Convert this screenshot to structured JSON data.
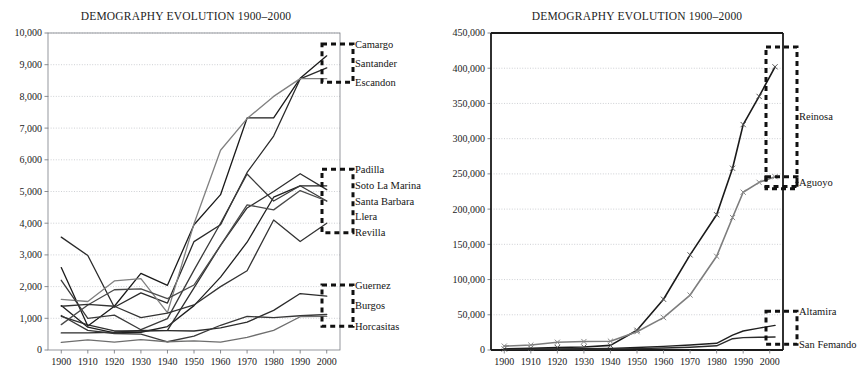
{
  "figure": {
    "name": "demography-evolution-two-panel-figure",
    "width": 866,
    "height": 387,
    "background": "#ffffff"
  },
  "chart_data": [
    {
      "panel": "left",
      "type": "line",
      "title": "DEMOGRAPHY EVOLUTION 1900–2000",
      "xlabel": "",
      "ylabel": "",
      "grid": true,
      "legend_position": "right-of-plot (direct line labels)",
      "x": [
        1900,
        1910,
        1920,
        1930,
        1940,
        1950,
        1960,
        1970,
        1980,
        1990,
        2000
      ],
      "xlim": [
        1895,
        2005
      ],
      "ylim": [
        0,
        10000
      ],
      "yticks": [
        0,
        1000,
        2000,
        3000,
        4000,
        5000,
        6000,
        7000,
        8000,
        9000,
        10000
      ],
      "ytick_labels": [
        "0",
        "1,000",
        "2,000",
        "3,000",
        "4,000",
        "5,000",
        "6,000",
        "7,000",
        "8,000",
        "9,000",
        "10,000"
      ],
      "xtick_labels": [
        "1900",
        "1910",
        "1920",
        "1930",
        "1940",
        "1950",
        "1960",
        "1970",
        "1980",
        "1990",
        "2000"
      ],
      "highlight_groups": [
        {
          "label_group": [
            "Camargo",
            "Santander",
            "Escandon"
          ],
          "y_top": 9650,
          "y_bottom": 8450
        },
        {
          "label_group": [
            "Padilla",
            "Soto La Marina",
            "Santa Barbara",
            "Llera",
            "Revilla"
          ],
          "y_top": 5700,
          "y_bottom": 3700
        },
        {
          "label_group": [
            "Guernez",
            "Burgos",
            "Horcasitas"
          ],
          "y_top": 2050,
          "y_bottom": 750
        }
      ],
      "series": [
        {
          "name": "Camargo",
          "color": "#1a1a1a",
          "width": 1.3,
          "values": [
            2600,
            760,
            1380,
            2420,
            2040,
            3950,
            4900,
            7320,
            7320,
            8570,
            9280
          ]
        },
        {
          "name": "Santander",
          "color": "#2a2a2a",
          "width": 1.3,
          "values": [
            3560,
            2980,
            1350,
            1800,
            1480,
            3420,
            3950,
            5600,
            6750,
            8550,
            8900
          ]
        },
        {
          "name": "Escandon",
          "color": "#808080",
          "width": 1.3,
          "values": [
            1600,
            1530,
            2180,
            2250,
            1180,
            3980,
            6300,
            7300,
            8000,
            8560,
            8560
          ]
        },
        {
          "name": "Padilla",
          "color": "#1f1f1f",
          "width": 1.3,
          "values": [
            1400,
            720,
            540,
            560,
            740,
            1400,
            2300,
            3400,
            4820,
            5180,
            5180
          ]
        },
        {
          "name": "Soto La Marina",
          "color": "#2e2e2e",
          "width": 1.3,
          "values": [
            1060,
            790,
            600,
            600,
            620,
            1960,
            3300,
            4480,
            5000,
            5560,
            5060
          ]
        },
        {
          "name": "Santa Barbara",
          "color": "#3a3a3a",
          "width": 1.3,
          "values": [
            2200,
            1000,
            1100,
            640,
            990,
            2520,
            4000,
            5550,
            4700,
            5180,
            4700
          ]
        },
        {
          "name": "Llera",
          "color": "#4a4a4a",
          "width": 1.3,
          "values": [
            800,
            1420,
            1900,
            1930,
            1620,
            2050,
            3300,
            4580,
            4420,
            5030,
            4700
          ]
        },
        {
          "name": "Revilla",
          "color": "#333333",
          "width": 1.3,
          "values": [
            1380,
            1440,
            1380,
            1020,
            1160,
            1420,
            2000,
            2500,
            4100,
            3420,
            4000
          ]
        },
        {
          "name": "Guernez",
          "color": "#2b2b2b",
          "width": 1.3,
          "values": [
            540,
            540,
            560,
            620,
            610,
            600,
            700,
            880,
            1250,
            1780,
            1700
          ]
        },
        {
          "name": "Burgos",
          "color": "#383838",
          "width": 1.3,
          "values": [
            1090,
            620,
            520,
            500,
            260,
            440,
            780,
            1060,
            1020,
            1080,
            1120
          ]
        },
        {
          "name": "Horcasitas",
          "color": "#6e6e6e",
          "width": 1.3,
          "values": [
            240,
            320,
            250,
            330,
            260,
            290,
            250,
            400,
            620,
            1050,
            1060
          ]
        }
      ]
    },
    {
      "panel": "right",
      "type": "line",
      "title": "DEMOGRAPHY EVOLUTION 1900–2000",
      "xlabel": "",
      "ylabel": "",
      "grid": true,
      "legend_position": "right-of-plot (direct line labels)",
      "x": [
        1900,
        1910,
        1920,
        1930,
        1940,
        1950,
        1960,
        1970,
        1980,
        1990,
        2000
      ],
      "xlim": [
        1895,
        2005
      ],
      "ylim": [
        0,
        450000
      ],
      "yticks": [
        0,
        50000,
        100000,
        150000,
        200000,
        250000,
        300000,
        350000,
        400000,
        450000
      ],
      "ytick_labels": [
        "0",
        "50,000",
        "100,000",
        "150,000",
        "200,000",
        "250,000",
        "300,000",
        "350,000",
        "400,000",
        "450,000"
      ],
      "xtick_labels": [
        "1900",
        "1910",
        "1920",
        "1930",
        "1940",
        "1950",
        "1960",
        "1970",
        "1980",
        "1990",
        "2000"
      ],
      "highlight_groups": [
        {
          "label_group": [
            "Reinosa"
          ],
          "y_top": 430000,
          "y_bottom": 232000
        },
        {
          "label_group": [
            "Aguoyo"
          ],
          "y_top": 246000,
          "y_bottom": 232000
        },
        {
          "label_group": [
            "Altamira",
            "San Femando"
          ],
          "y_top": 55000,
          "y_bottom": 8000
        }
      ],
      "series": [
        {
          "name": "Reinosa",
          "color": "#1a1a1a",
          "color_marker": "#555555",
          "marker": "x",
          "width": 1.6,
          "values": [
            1500,
            2500,
            3500,
            4200,
            6500,
            28000,
            72000,
            135000,
            192000,
            258000,
            320000,
            360000,
            402000
          ]
        },
        {
          "name": "Aguoyo",
          "color": "#7d7d7d",
          "color_marker": "#8a8a8a",
          "marker": "x",
          "width": 1.6,
          "values": [
            5500,
            7000,
            11000,
            12000,
            12500,
            26000,
            46000,
            78000,
            133000,
            188000,
            224000,
            238000,
            246000
          ]
        },
        {
          "name": "Altamira",
          "color": "#1f1f1f",
          "color_marker": "#1f1f1f",
          "marker": "none",
          "width": 1.4,
          "values": [
            1200,
            1400,
            1500,
            1800,
            2300,
            3600,
            5200,
            7000,
            9500,
            21000,
            27000,
            31000,
            35000
          ]
        },
        {
          "name": "San Femando",
          "color": "#2b2b2b",
          "color_marker": "#2b2b2b",
          "marker": "none",
          "width": 1.4,
          "values": [
            900,
            1000,
            1100,
            1200,
            1400,
            2000,
            2800,
            4000,
            6000,
            16000,
            17500,
            18000,
            18500
          ]
        }
      ],
      "series_x_extended": [
        1900,
        1910,
        1920,
        1930,
        1940,
        1950,
        1960,
        1970,
        1980,
        1986,
        1990,
        1996,
        2002
      ]
    }
  ]
}
